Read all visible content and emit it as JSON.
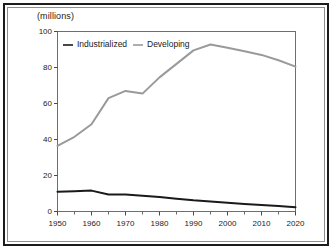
{
  "chart_data": {
    "type": "line",
    "title": "",
    "subtitle": "",
    "unit_caption": "(millions)",
    "xlabel": "",
    "ylabel": "",
    "xlim": [
      1950,
      2020
    ],
    "ylim": [
      0,
      100
    ],
    "grid": false,
    "legend_position": "top-left-inside",
    "y_ticks": [
      0,
      20,
      40,
      60,
      80,
      100
    ],
    "y_tick_labels": [
      "0",
      "20",
      "40",
      "60",
      "80",
      "100"
    ],
    "x_ticks": [
      1950,
      1960,
      1970,
      1980,
      1990,
      2000,
      2010,
      2020
    ],
    "x_tick_labels": [
      "1950",
      "1960",
      "1970",
      "1980",
      "1990",
      "2000",
      "2010",
      "2020"
    ],
    "x_minor_ticks": [
      1955,
      1965,
      1975,
      1985,
      1995,
      2005,
      2015
    ],
    "x": [
      1950,
      1955,
      1960,
      1965,
      1970,
      1975,
      1980,
      1985,
      1990,
      1995,
      2000,
      2005,
      2010,
      2015,
      2020
    ],
    "series": [
      {
        "name": "Industrialized",
        "color": "#1a1a1a",
        "width": 2.0,
        "values": [
          11.0,
          11.3,
          11.6,
          9.4,
          9.5,
          8.8,
          8.1,
          7.1,
          6.2,
          5.6,
          4.9,
          4.2,
          3.6,
          3.0,
          2.4
        ]
      },
      {
        "name": "Developing",
        "color": "#9a9a9a",
        "width": 2.0,
        "values": [
          36.5,
          41.5,
          48.5,
          63.0,
          67.0,
          65.5,
          74.5,
          82.0,
          89.5,
          92.8,
          91.0,
          89.0,
          87.0,
          84.0,
          80.5
        ]
      }
    ]
  },
  "legend": {
    "items": [
      {
        "label": "Industrialized",
        "color": "#1a1a1a"
      },
      {
        "label": "Developing",
        "color": "#9a9a9a"
      }
    ]
  },
  "axes": {
    "unit_caption": "(millions)"
  }
}
